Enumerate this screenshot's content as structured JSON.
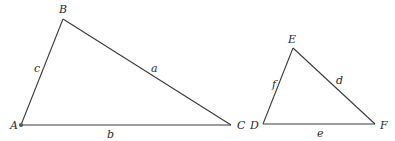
{
  "diagram": {
    "title": "",
    "triangles": [
      {
        "name": "triangle-abc",
        "vertices": [
          {
            "label": "A",
            "x": 21,
            "y": 125,
            "lx": 10,
            "ly": 129
          },
          {
            "label": "B",
            "x": 63,
            "y": 19,
            "lx": 59,
            "ly": 13
          },
          {
            "label": "C",
            "x": 231,
            "y": 125,
            "lx": 237,
            "ly": 129
          }
        ],
        "sides": [
          {
            "label": "c",
            "between": "A-B",
            "lx": 34,
            "ly": 72
          },
          {
            "label": "a",
            "between": "B-C",
            "lx": 151,
            "ly": 72
          },
          {
            "label": "b",
            "between": "A-C",
            "lx": 107,
            "ly": 138
          }
        ],
        "marked_vertex": "A"
      },
      {
        "name": "triangle-def",
        "vertices": [
          {
            "label": "D",
            "x": 263,
            "y": 124,
            "lx": 250,
            "ly": 129
          },
          {
            "label": "E",
            "x": 293,
            "y": 48,
            "lx": 288,
            "ly": 43
          },
          {
            "label": "F",
            "x": 375,
            "y": 124,
            "lx": 380,
            "ly": 129
          }
        ],
        "sides": [
          {
            "label": "f",
            "between": "D-E",
            "lx": 272,
            "ly": 88
          },
          {
            "label": "d",
            "between": "E-F",
            "lx": 336,
            "ly": 84
          },
          {
            "label": "e",
            "between": "D-F",
            "lx": 317,
            "ly": 137
          }
        ]
      }
    ],
    "colors": {
      "line": "#3a3a3a",
      "text": "#2a2a2a",
      "background": "#ffffff"
    }
  }
}
